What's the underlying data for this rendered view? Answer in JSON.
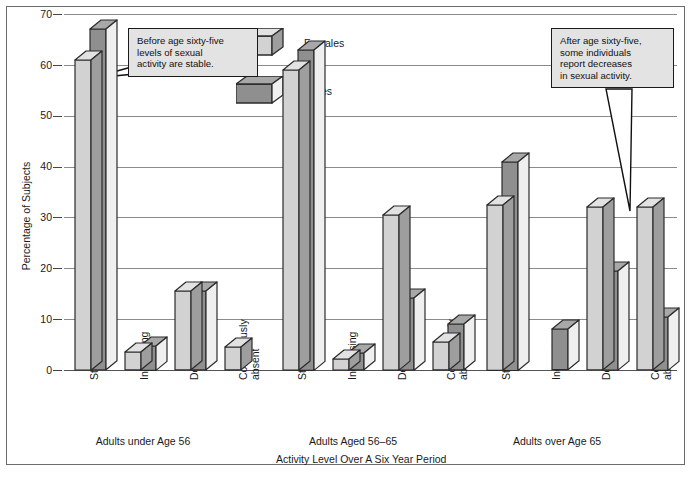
{
  "chart_data": {
    "type": "bar",
    "title": "",
    "xlabel": "Activity Level Over A Six Year Period",
    "ylabel": "Percentage of Subjects",
    "ylim": [
      0,
      70
    ],
    "yticks": [
      0,
      10,
      20,
      30,
      40,
      50,
      60,
      70
    ],
    "grid": true,
    "legend_position": "top-center",
    "categories": [
      "Stable",
      "Increasing",
      "Decreasing",
      "Continuously absent"
    ],
    "groups": [
      {
        "label": "Adults under Age 56",
        "series": [
          {
            "name": "Females",
            "values": [
              61,
              3.5,
              15.5,
              4.5
            ]
          },
          {
            "name": "Males",
            "values": [
              67,
              4.8,
              15.5,
              null
            ]
          }
        ]
      },
      {
        "label": "Adults Aged 56–65",
        "series": [
          {
            "name": "Females",
            "values": [
              59,
              2.2,
              30.5,
              5.5
            ]
          },
          {
            "name": "Males",
            "values": [
              63,
              3.3,
              14.2,
              9
            ]
          }
        ]
      },
      {
        "label": "Adults over Age 65",
        "series": [
          {
            "name": "Females",
            "values": [
              32.5,
              null,
              32,
              32
            ]
          },
          {
            "name": "Males",
            "values": [
              41,
              8,
              19.5,
              10.5
            ]
          }
        ]
      }
    ],
    "legend": [
      {
        "name": "Females",
        "color": "#d2d2d2"
      },
      {
        "name": "Males",
        "color": "#8f8f8f"
      }
    ],
    "annotations": [
      {
        "id": "callout-before-65",
        "lines": [
          "Before age sixty-five",
          "levels of sexual",
          "activity are stable."
        ]
      },
      {
        "id": "callout-after-65",
        "lines": [
          "After age sixty-five,",
          "some individuals",
          "report decreases",
          "in sexual activity."
        ]
      }
    ]
  },
  "colors": {
    "females": "#d2d2d2",
    "males": "#8f8f8f",
    "outline": "#2b2b2b",
    "gridline": "#8a8a8a",
    "callout_bg": "#e3e3e3",
    "frame": "#6b6b6b"
  },
  "yticks": {
    "t0": "0",
    "t1": "10",
    "t2": "20",
    "t3": "30",
    "t4": "40",
    "t5": "50",
    "t6": "60",
    "t7": "70"
  },
  "cats": {
    "c0": "Stable",
    "c1": "Increasing",
    "c2": "Decreasing",
    "c3a": "Continuously",
    "c3b": "absent"
  },
  "groups": {
    "g0": "Adults under Age 56",
    "g1": "Adults Aged 56–65",
    "g2": "Adults over Age 65"
  },
  "legend": {
    "females": "Females",
    "males": "Males"
  },
  "axis": {
    "y_title": "Percentage of Subjects",
    "x_title": "Activity Level Over A Six Year Period"
  },
  "callout1": {
    "l1": "Before age sixty-five",
    "l2": "levels of sexual",
    "l3": "activity are stable."
  },
  "callout2": {
    "l1": "After age sixty-five,",
    "l2": "some individuals",
    "l3": "report decreases",
    "l4": "in sexual activity."
  }
}
